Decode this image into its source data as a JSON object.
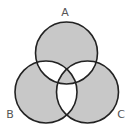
{
  "diagram": {
    "type": "venn",
    "sets": [
      {
        "name": "A",
        "label": "A",
        "cx": 66.5,
        "cy": 53,
        "r": 31
      },
      {
        "name": "B",
        "label": "B",
        "cx": 46,
        "cy": 92,
        "r": 31
      },
      {
        "name": "C",
        "label": "C",
        "cx": 87.5,
        "cy": 92,
        "r": 31
      }
    ],
    "shaded_regions": [
      "A only",
      "B only",
      "C only",
      "A∩B∩C"
    ],
    "unshaded_regions": [
      "A∩B only",
      "A∩C only",
      "B∩C only"
    ],
    "colors": {
      "shade": "#c8c8c8",
      "stroke": "#222222",
      "background": "#ffffff",
      "label": "#555555"
    }
  }
}
